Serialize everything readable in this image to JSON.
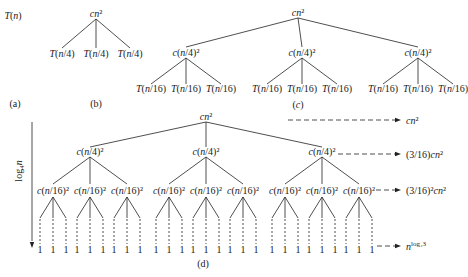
{
  "diagram": {
    "type": "recursion-tree",
    "panels": {
      "a": {
        "caption": "(a)",
        "root": "T(n)"
      },
      "b": {
        "caption": "(b)",
        "root": "cn²",
        "children": [
          "T(n/4)",
          "T(n/4)",
          "T(n/4)"
        ]
      },
      "c": {
        "caption": "(c)",
        "root": "cn²",
        "level1": [
          "c(n/4)²",
          "c(n/4)²",
          "c(n/4)²"
        ],
        "leaves": [
          "T(n/16)",
          "T(n/16)",
          "T(n/16)",
          "T(n/16)",
          "T(n/16)",
          "T(n/16)",
          "T(n/16)",
          "T(n/16)",
          "T(n/16)"
        ]
      },
      "d": {
        "caption": "(d)",
        "root": "cn²",
        "level1": [
          "c(n/4)²",
          "c(n/4)²",
          "c(n/4)²"
        ],
        "level2": [
          "c(n/16)²",
          "c(n/16)²",
          "c(n/16)²",
          "c(n/16)²",
          "c(n/16)²",
          "c(n/16)²",
          "c(n/16)²",
          "c(n/16)²",
          "c(n/16)²"
        ],
        "leaf_label": "1",
        "height_label": "log₄n",
        "level_costs": [
          "cn²",
          "(3/16)cn²",
          "(3/16)²cn²",
          "n^log₄3"
        ]
      }
    }
  }
}
